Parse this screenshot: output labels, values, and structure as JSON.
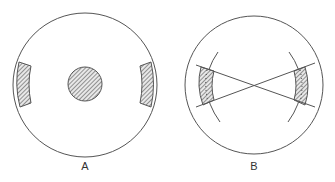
{
  "figure": {
    "panels": [
      {
        "id": "A",
        "label": "A",
        "description": "Outer circle with a hatched central disk and two hatched arc-shaped patches on the left and right edges"
      },
      {
        "id": "B",
        "label": "B",
        "description": "Outer circle with two inner concentric arcs; hatched arc segments on left and right bounded by two crossing straight lines"
      }
    ],
    "colors": {
      "stroke": "#555555",
      "hatch": "#666666",
      "background": "#ffffff"
    }
  }
}
